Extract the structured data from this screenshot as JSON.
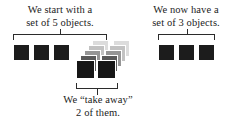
{
  "figure": {
    "background_color": "#ffffff",
    "ink_color": "#2b2b2b",
    "object_color": "#1c1c1c"
  },
  "captions": {
    "left": {
      "line1": "We start with a",
      "line2": "set of 5 objects."
    },
    "right": {
      "line1": "We now have a",
      "line2": "set of 3 objects."
    },
    "bottom": {
      "line1": "We “take away”",
      "line2": "2 of them."
    }
  },
  "groups": {
    "start_set": {
      "label": "starting set of 5 objects",
      "count": 5,
      "remaining_count": 3,
      "removed_count": 2
    },
    "taken_away": {
      "label": "objects taken away",
      "count": 2
    },
    "result_set": {
      "label": "resulting set of 3 objects",
      "count": 3
    }
  },
  "squares": {
    "left_row": [
      {
        "x": 13,
        "y": 44,
        "size": 17,
        "color": "#1c1c1c",
        "opacity": 1
      },
      {
        "x": 33,
        "y": 44,
        "size": 17,
        "color": "#1c1c1c",
        "opacity": 1
      },
      {
        "x": 53,
        "y": 44,
        "size": 17,
        "color": "#1c1c1c",
        "opacity": 1
      }
    ],
    "ghost_trail_a": [
      {
        "x": 92,
        "y": 40,
        "size": 17,
        "color": "#dcdcdc",
        "opacity": 1
      },
      {
        "x": 88,
        "y": 45,
        "size": 17,
        "color": "#c2c2c2",
        "opacity": 1
      },
      {
        "x": 84,
        "y": 50,
        "size": 17,
        "color": "#969696",
        "opacity": 1
      },
      {
        "x": 80,
        "y": 55,
        "size": 17,
        "color": "#5a5a5a",
        "opacity": 1
      },
      {
        "x": 76,
        "y": 60,
        "size": 19,
        "color": "#161616",
        "opacity": 1
      }
    ],
    "ghost_trail_b": [
      {
        "x": 113,
        "y": 40,
        "size": 17,
        "color": "#dcdcdc",
        "opacity": 1
      },
      {
        "x": 109,
        "y": 45,
        "size": 17,
        "color": "#c2c2c2",
        "opacity": 1
      },
      {
        "x": 105,
        "y": 50,
        "size": 17,
        "color": "#969696",
        "opacity": 1
      },
      {
        "x": 101,
        "y": 55,
        "size": 17,
        "color": "#5a5a5a",
        "opacity": 1
      },
      {
        "x": 97,
        "y": 60,
        "size": 19,
        "color": "#161616",
        "opacity": 1
      }
    ],
    "right_row": [
      {
        "x": 158,
        "y": 44,
        "size": 17,
        "color": "#1c1c1c",
        "opacity": 1
      },
      {
        "x": 178,
        "y": 44,
        "size": 17,
        "color": "#1c1c1c",
        "opacity": 1
      },
      {
        "x": 198,
        "y": 44,
        "size": 17,
        "color": "#1c1c1c",
        "opacity": 1
      }
    ]
  },
  "brackets": {
    "left": {
      "x": 13,
      "y": 34,
      "width": 94,
      "direction": "down"
    },
    "right": {
      "x": 158,
      "y": 34,
      "width": 57,
      "direction": "down"
    },
    "bottom": {
      "x": 76,
      "y": 82,
      "width": 42,
      "direction": "up"
    }
  }
}
